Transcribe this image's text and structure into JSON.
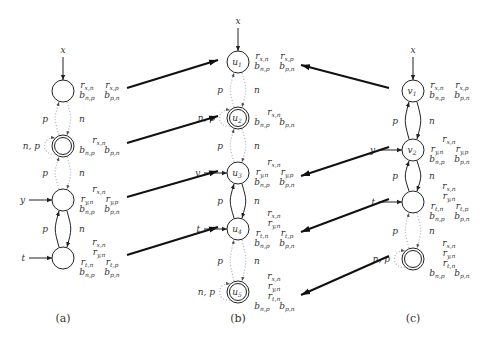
{
  "figure": {
    "panels": [
      {
        "id": "a",
        "caption": "(a)",
        "nodes": [
          {
            "id": "a1",
            "name": "",
            "accepting": false,
            "input": "x",
            "annot": [
              [
                "r",
                "x,n",
                "r",
                "x,p"
              ],
              [
                "b",
                "n,p",
                "b",
                "p,n"
              ]
            ]
          },
          {
            "id": "a2",
            "name": "",
            "accepting": true,
            "selfloop": "n, p",
            "annot": [
              [
                "r",
                "x,n"
              ],
              [
                "b",
                "n,p",
                "b",
                "p,n"
              ]
            ]
          },
          {
            "id": "a3",
            "name": "",
            "accepting": false,
            "input": "y",
            "annot": [
              [
                "r",
                "x,n"
              ],
              [
                "r",
                "y,n",
                "r",
                "y,p"
              ],
              [
                "b",
                "n,p",
                "b",
                "p,n"
              ]
            ]
          },
          {
            "id": "a4",
            "name": "",
            "accepting": false,
            "input": "t",
            "annot": [
              [
                "r",
                "x,n"
              ],
              [
                "r",
                "y,n"
              ],
              [
                "r",
                "t,n",
                "r",
                "t,p"
              ],
              [
                "b",
                "n,p",
                "b",
                "p,n"
              ]
            ]
          }
        ],
        "edges": [
          {
            "between": "a1-a2",
            "left": "p",
            "right": "n",
            "style": "dotted"
          },
          {
            "between": "a2-a3",
            "left": "p",
            "right": "n",
            "style": "dotted"
          },
          {
            "between": "a3-a4",
            "left": "p",
            "right": "n",
            "style": "solid"
          }
        ]
      },
      {
        "id": "b",
        "caption": "(b)",
        "nodes": [
          {
            "id": "u1",
            "name": "u",
            "sub": "1",
            "accepting": false,
            "input": "x",
            "annot": [
              [
                "r",
                "x,n",
                "r",
                "x,p"
              ],
              [
                "b",
                "n,p",
                "b",
                "p,n"
              ]
            ]
          },
          {
            "id": "u2",
            "name": "u",
            "sub": "2",
            "accepting": true,
            "selfloop": "n, p",
            "annot": [
              [
                "r",
                "x,n"
              ],
              [
                "b",
                "n,p",
                "b",
                "p,n"
              ]
            ]
          },
          {
            "id": "u3",
            "name": "u",
            "sub": "3",
            "accepting": false,
            "input": "y",
            "annot": [
              [
                "r",
                "x,n"
              ],
              [
                "r",
                "y,n",
                "r",
                "y,p"
              ],
              [
                "b",
                "n,p",
                "b",
                "p,n"
              ]
            ]
          },
          {
            "id": "u4",
            "name": "u",
            "sub": "4",
            "accepting": false,
            "input": "t",
            "annot": [
              [
                "r",
                "x,n"
              ],
              [
                "r",
                "y,n"
              ],
              [
                "r",
                "t,n",
                "r",
                "t,p"
              ],
              [
                "b",
                "n,p",
                "b",
                "p,n"
              ]
            ]
          },
          {
            "id": "u5",
            "name": "u",
            "sub": "5",
            "accepting": true,
            "selfloop": "n, p",
            "annot": [
              [
                "r",
                "x,n"
              ],
              [
                "r",
                "y,n"
              ],
              [
                "r",
                "t,n"
              ],
              [
                "b",
                "n,p",
                "b",
                "p,n"
              ]
            ]
          }
        ],
        "edges": [
          {
            "between": "u1-u2",
            "left": "p",
            "right": "n",
            "style": "dotted"
          },
          {
            "between": "u2-u3",
            "left": "p",
            "right": "n",
            "style": "dotted"
          },
          {
            "between": "u3-u4",
            "left": "p",
            "right": "n",
            "style": "solid"
          },
          {
            "between": "u4-u5",
            "left": "p",
            "right": "n",
            "style": "dotted"
          }
        ]
      },
      {
        "id": "c",
        "caption": "(c)",
        "nodes": [
          {
            "id": "v1",
            "name": "v",
            "sub": "1",
            "accepting": false,
            "input": "x",
            "annot": [
              [
                "r",
                "x,n",
                "r",
                "x,p"
              ],
              [
                "b",
                "n,p",
                "b",
                "p,n"
              ]
            ]
          },
          {
            "id": "v2",
            "name": "v",
            "sub": "2",
            "accepting": false,
            "input": "y",
            "annot": [
              [
                "r",
                "x,n"
              ],
              [
                "r",
                "y,n",
                "r",
                "y,p"
              ],
              [
                "b",
                "n,p",
                "b",
                "p,n"
              ]
            ]
          },
          {
            "id": "c3",
            "name": "",
            "accepting": false,
            "input": "t",
            "annot": [
              [
                "r",
                "x,n"
              ],
              [
                "r",
                "y,n"
              ],
              [
                "r",
                "t,n",
                "r",
                "t,p"
              ],
              [
                "b",
                "n,p",
                "b",
                "p,n"
              ]
            ]
          },
          {
            "id": "c4",
            "name": "",
            "accepting": true,
            "selfloop": "n, p",
            "annot": [
              [
                "r",
                "x,n"
              ],
              [
                "r",
                "y,n"
              ],
              [
                "r",
                "t,n"
              ],
              [
                "b",
                "n,p",
                "b",
                "p,n"
              ]
            ]
          }
        ],
        "edges": [
          {
            "between": "v1-v2",
            "left": "p",
            "right": "n",
            "style": "solid"
          },
          {
            "between": "v2-c3",
            "left": "p",
            "right": "n",
            "style": "solid"
          },
          {
            "between": "c3-c4",
            "left": "p",
            "right": "n",
            "style": "dotted"
          }
        ]
      }
    ],
    "mappings": [
      {
        "from": "a1",
        "to": "u1"
      },
      {
        "from": "a2",
        "to": "u2"
      },
      {
        "from": "a3",
        "to": "u3"
      },
      {
        "from": "a4",
        "to": "u4"
      },
      {
        "from": "v1",
        "to": "u1"
      },
      {
        "from": "v2",
        "to": "u3"
      },
      {
        "from": "c3",
        "to": "u4"
      },
      {
        "from": "c4",
        "to": "u5"
      }
    ]
  }
}
